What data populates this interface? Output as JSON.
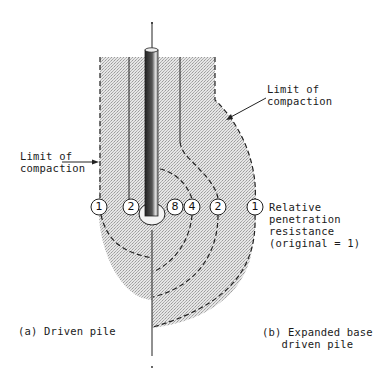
{
  "labels": {
    "limit_left": [
      "Limit of",
      "compaction"
    ],
    "limit_right": [
      "Limit of",
      "compaction"
    ],
    "resistance": [
      "Relative",
      "penetration",
      "resistance",
      "(original = 1)"
    ],
    "caption_a": "(a)  Driven  pile",
    "caption_b": [
      "(b) Expanded base",
      "driven pile"
    ]
  },
  "contours": {
    "left": [
      {
        "value": "1",
        "x": 99,
        "y": 207
      },
      {
        "value": "2",
        "x": 131,
        "y": 207
      }
    ],
    "right": [
      {
        "value": "8",
        "x": 175,
        "y": 207
      },
      {
        "value": "4",
        "x": 192,
        "y": 207
      },
      {
        "value": "2",
        "x": 218,
        "y": 207
      },
      {
        "value": "1",
        "x": 255,
        "y": 207
      }
    ]
  },
  "colors": {
    "ink": "#1a1a1a",
    "shading": "#d9d9d9",
    "pile": "#3a3a3a"
  }
}
